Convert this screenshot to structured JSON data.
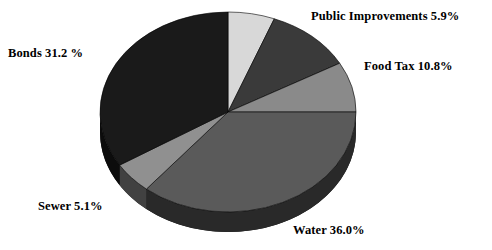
{
  "chart_data": {
    "type": "pie",
    "title": "",
    "labels": [
      "Public Improvements",
      "Food Tax",
      "Water",
      "Sewer",
      "Bonds"
    ],
    "values": [
      5.9,
      10.8,
      36.0,
      5.1,
      31.2
    ],
    "unit": "%",
    "labeled_total": 89.0,
    "unlabeled_slice_value": 11.0,
    "legend": "none",
    "grid": false,
    "style": "3d-exploded-none",
    "slices": [
      {
        "name": "public-improvements",
        "label": "Public Improvements",
        "value": 5.9,
        "value_text": "5.9%",
        "label_text": "Public Improvements 5.9%",
        "color": "#d8d8d8",
        "start_angle": 0,
        "end_angle": 21.2
      },
      {
        "name": "unlabeled",
        "label": "",
        "value": 11.0,
        "value_text": "",
        "label_text": "",
        "color": "#3a3a3a",
        "start_angle": 21.2,
        "end_angle": 60.8
      },
      {
        "name": "food-tax",
        "label": "Food Tax",
        "value": 10.8,
        "value_text": "10.8%",
        "label_text": "Food Tax 10.8%",
        "color": "#8a8a8a",
        "start_angle": 60.8,
        "end_angle": 90.0
      },
      {
        "name": "water",
        "label": "Water",
        "value": 36.0,
        "value_text": "36.0%",
        "label_text": "Water 36.0%",
        "color": "#5a5a5a",
        "start_angle": 90.0,
        "end_angle": 219.6
      },
      {
        "name": "sewer",
        "label": "Sewer",
        "value": 5.1,
        "value_text": "5.1%",
        "label_text": "Sewer 5.1%",
        "color": "#909090",
        "start_angle": 219.6,
        "end_angle": 237.9
      },
      {
        "name": "bonds",
        "label": "Bonds",
        "value": 31.2,
        "value_text": "31.2 %",
        "label_text": "Bonds 31.2 %",
        "color": "#1a1a1a",
        "start_angle": 237.9,
        "end_angle": 360.0
      }
    ],
    "colors": {
      "public_improvements": "#d8d8d8",
      "unlabeled": "#3a3a3a",
      "food_tax": "#8a8a8a",
      "water": "#5a5a5a",
      "sewer": "#909090",
      "bonds": "#1a1a1a",
      "background": "#ffffff",
      "text": "#000000",
      "depth_shadow": "#141414"
    },
    "geometry": {
      "center_x": 228,
      "center_y": 112,
      "radius_x": 128,
      "radius_y": 100,
      "depth": 20
    }
  },
  "labels": {
    "public_improvements": "Public Improvements 5.9%",
    "food_tax": "Food Tax 10.8%",
    "bonds": "Bonds 31.2 %",
    "sewer": "Sewer 5.1%",
    "water": "Water 36.0%"
  }
}
